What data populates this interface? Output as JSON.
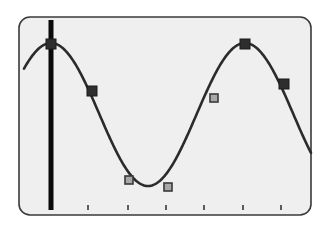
{
  "chart_data": {
    "type": "line",
    "title": "",
    "xlabel": "",
    "ylabel": "",
    "grid": false,
    "legend": null,
    "curve": {
      "function": "cosine",
      "period_px": 194,
      "amplitude_px": 71.5,
      "center_y_px": 114.5,
      "phase_peak_x_px": 51,
      "x_start_px": 24,
      "x_end_px": 311,
      "color": "#2b2b2b"
    },
    "x_ticks_px": [
      88,
      128,
      166,
      204,
      243,
      281
    ],
    "tick_labels": [],
    "cursor": {
      "x_px": 51,
      "y_top_px": 20,
      "y_bottom_px": 210,
      "width_px": 5,
      "color": "#0a0a0a"
    },
    "markers": [
      {
        "x": 51,
        "y": 44,
        "style": "dark"
      },
      {
        "x": 92,
        "y": 91,
        "style": "dark"
      },
      {
        "x": 129,
        "y": 180,
        "style": "light"
      },
      {
        "x": 168,
        "y": 187,
        "style": "light"
      },
      {
        "x": 214,
        "y": 98,
        "style": "light"
      },
      {
        "x": 245,
        "y": 44,
        "style": "dark"
      },
      {
        "x": 284,
        "y": 84,
        "style": "dark"
      }
    ],
    "series": [
      {
        "name": "samples",
        "values": [
          1.0,
          0.34,
          -0.91,
          -1.0,
          0.23,
          1.0,
          0.43
        ]
      }
    ]
  },
  "frame": {
    "x": 19,
    "y": 17,
    "width": 292,
    "height": 198,
    "radius": 11,
    "fill": "#efefef",
    "stroke": "#3a3a3a"
  },
  "colors": {
    "marker_dark_fill": "#2e2e2e",
    "marker_dark_stroke": "#1a1a1a",
    "marker_light_fill": "#a8a8a8",
    "marker_light_stroke": "#3a3a3a",
    "tick": "#2a2a2a"
  }
}
